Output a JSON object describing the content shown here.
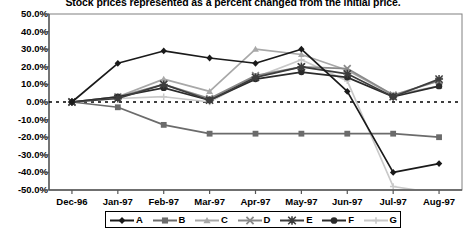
{
  "chart_data": {
    "type": "line",
    "title": "Stock prices represented as a percent changed from the initial price.",
    "xlabel": "",
    "ylabel": "",
    "categories": [
      "Dec-96",
      "Jan-97",
      "Feb-97",
      "Mar-97",
      "Apr-97",
      "May-97",
      "Jun-97",
      "Jul-97",
      "Aug-97"
    ],
    "ylim": [
      -50,
      50
    ],
    "ytick_labels": [
      "50.0%",
      "40.0%",
      "30.0%",
      "20.0%",
      "10.0%",
      "0.0%",
      "-10.0%",
      "-20.0%",
      "-30.0%",
      "-40.0%",
      "-50.0%"
    ],
    "ytick_values": [
      50,
      40,
      30,
      20,
      10,
      0,
      -10,
      -20,
      -30,
      -40,
      -50
    ],
    "grid": false,
    "zero_line": true,
    "legend_position": "bottom",
    "series": [
      {
        "name": "A",
        "marker": "diamond",
        "color": "#1a1a1a",
        "values": [
          0,
          22,
          29,
          25,
          22,
          30,
          6,
          -40,
          -35
        ]
      },
      {
        "name": "B",
        "marker": "square",
        "color": "#6b6b6b",
        "values": [
          0,
          -3,
          -13,
          -18,
          -18,
          -18,
          -18,
          -18,
          -20
        ]
      },
      {
        "name": "C",
        "marker": "triangle",
        "color": "#a8a8a8",
        "values": [
          0,
          3,
          13,
          6,
          30,
          27,
          18,
          4,
          9
        ]
      },
      {
        "name": "D",
        "marker": "cross",
        "color": "#8a8a8a",
        "values": [
          0,
          3,
          10,
          2,
          15,
          20,
          19,
          4,
          12
        ]
      },
      {
        "name": "E",
        "marker": "asterisk",
        "color": "#3d3d3d",
        "values": [
          0,
          2,
          10,
          1,
          14,
          20,
          16,
          3,
          13
        ]
      },
      {
        "name": "F",
        "marker": "circle",
        "color": "#2b2b2b",
        "values": [
          0,
          3,
          8,
          1,
          13,
          17,
          14,
          3,
          9
        ]
      },
      {
        "name": "G",
        "marker": "line",
        "color": "#c9c9c9",
        "values": [
          0,
          2,
          3,
          0,
          14,
          24,
          12,
          -48,
          -52
        ]
      }
    ]
  },
  "legend": {
    "items": [
      {
        "label": "A"
      },
      {
        "label": "B"
      },
      {
        "label": "C"
      },
      {
        "label": "D"
      },
      {
        "label": "E"
      },
      {
        "label": "F"
      },
      {
        "label": "G"
      }
    ]
  }
}
